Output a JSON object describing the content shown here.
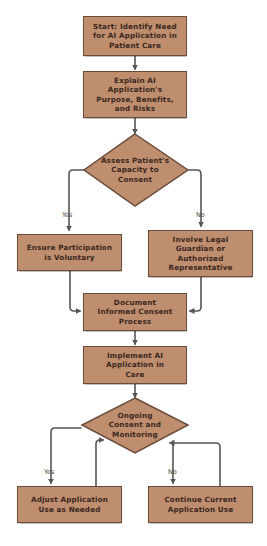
{
  "diagram": {
    "type": "flowchart",
    "colors": {
      "node_fill": "#bf8e6e",
      "node_border": "#6a4c3a",
      "text": "#3a2820",
      "connector": "#555555",
      "background": "#ffffff"
    },
    "nodes": {
      "start": {
        "label": "Start: Identify Need for AI Application in Patient Care",
        "shape": "rectangle"
      },
      "explain": {
        "label": "Explain AI Application's Purpose, Benefits, and Risks",
        "shape": "rectangle"
      },
      "assess": {
        "label": "Assess Patient's Capacity to Consent",
        "shape": "diamond"
      },
      "voluntary": {
        "label": "Ensure Participation is Voluntary",
        "shape": "rectangle"
      },
      "guardian": {
        "label": "Involve Legal Guardian or Authorized Representative",
        "shape": "rectangle"
      },
      "document": {
        "label": "Document Informed Consent Process",
        "shape": "rectangle"
      },
      "implement": {
        "label": "Implement AI Application in Care",
        "shape": "rectangle"
      },
      "ongoing": {
        "label": "Ongoing Consent and Monitoring",
        "shape": "diamond"
      },
      "adjust": {
        "label": "Adjust Application Use as Needed",
        "shape": "rectangle"
      },
      "continue": {
        "label": "Continue Current Application Use",
        "shape": "rectangle"
      }
    },
    "edge_labels": {
      "assess_yes": "Yes",
      "assess_no": "No",
      "ongoing_yes": "Yes",
      "ongoing_no": "No"
    },
    "edges": [
      {
        "from": "start",
        "to": "explain"
      },
      {
        "from": "explain",
        "to": "assess"
      },
      {
        "from": "assess",
        "to": "voluntary",
        "label": "Yes"
      },
      {
        "from": "assess",
        "to": "guardian",
        "label": "No"
      },
      {
        "from": "voluntary",
        "to": "document"
      },
      {
        "from": "guardian",
        "to": "document"
      },
      {
        "from": "document",
        "to": "implement"
      },
      {
        "from": "implement",
        "to": "ongoing"
      },
      {
        "from": "ongoing",
        "to": "adjust",
        "label": "Yes"
      },
      {
        "from": "ongoing",
        "to": "continue",
        "label": "No"
      },
      {
        "from": "adjust",
        "to": "ongoing"
      },
      {
        "from": "continue",
        "to": "ongoing"
      }
    ]
  }
}
